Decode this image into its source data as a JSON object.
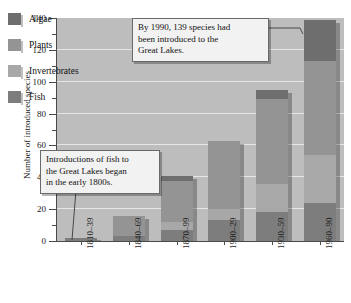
{
  "chart_data": {
    "type": "bar",
    "subtype": "stacked-bar",
    "title": "",
    "xlabel": "",
    "ylabel": "Number of introduced species",
    "ylim": [
      0,
      140
    ],
    "ytick_step": 20,
    "yticks": [
      0,
      20,
      40,
      60,
      80,
      100,
      120,
      140
    ],
    "minor_tick_step": 10,
    "grid": "horizontal",
    "legend_position": "inside-top-left",
    "categories": [
      "1810–39",
      "1840–69",
      "1870–99",
      "1900–29",
      "1930–59",
      "1960–90"
    ],
    "series": [
      {
        "name": "Fish",
        "color": "#7d7d7d",
        "values": [
          2,
          3,
          7,
          13,
          18,
          24
        ]
      },
      {
        "name": "Invertebrates",
        "color": "#a8a8a8",
        "values": [
          0,
          0,
          5,
          7,
          18,
          30
        ]
      },
      {
        "name": "Plants",
        "color": "#949494",
        "values": [
          0,
          13,
          26,
          43,
          53,
          59
        ]
      },
      {
        "name": "Algae",
        "color": "#6e6e6e",
        "values": [
          0,
          0,
          3,
          0,
          6,
          26
        ]
      }
    ],
    "totals": [
      2,
      16,
      41,
      63,
      95,
      139
    ],
    "annotations": [
      {
        "name": "callout-1990",
        "text": "By 1990, 139 species had been introduced to the Great Lakes.",
        "points_to": "1960–90"
      },
      {
        "name": "callout-fish",
        "text": "Introductions of fish to the Great Lakes began in the early 1800s.",
        "points_to": "1810–39"
      }
    ]
  },
  "legend": {
    "items": [
      {
        "label": "Algae",
        "color": "#6e6e6e"
      },
      {
        "label": "Plants",
        "color": "#949494"
      },
      {
        "label": "Invertebrates",
        "color": "#a8a8a8"
      },
      {
        "label": "Fish",
        "color": "#7d7d7d"
      }
    ]
  },
  "axes": {
    "y_title": "Number of introduced species",
    "y_labels": [
      "140",
      "120",
      "100",
      "80",
      "60",
      "40",
      "20",
      "0"
    ],
    "x_labels": [
      "1810–39",
      "1840–69",
      "1870–99",
      "1900–29",
      "1930–59",
      "1960–90"
    ]
  },
  "annotations": {
    "callout_1990": {
      "line1": "By 1990, 139 species had",
      "line2": "been introduced to the",
      "line3": "Great Lakes."
    },
    "callout_fish": {
      "line1": "Introductions of fish to",
      "line2": "the Great Lakes began",
      "line3": "in the early 1800s."
    }
  },
  "colors": {
    "plot_background": "#bdbdbd",
    "gridline": "#e6e6e6",
    "axis": "#4a4a4a",
    "callout_background": "#f2f2f2",
    "callout_border": "#6a6a6a"
  }
}
